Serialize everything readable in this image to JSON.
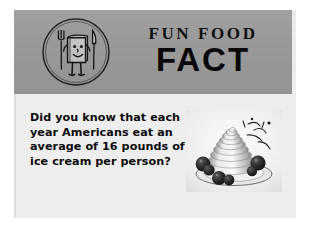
{
  "card": {
    "header": {
      "logo_icon": "fun-food-mascot-medallion-icon",
      "logo_description": "Circle medallion with smiling book mascot flanked by a fork and a knife",
      "title_line1": "FUN FOOD",
      "title_line2": "FACT",
      "background_color": "#9a9a9a"
    },
    "body": {
      "fact_text": "Did you know that each year Americans eat an average of 16 pounds of ice cream per person?",
      "background_color": "#efefef",
      "photo": {
        "icon": "ice-cream-sundae-photo",
        "description": "Black and white photograph of a swirled ice cream sundae with berries on a plate"
      }
    },
    "colors": {
      "page_background": "#ffffff",
      "card_background": "#ededed",
      "text_color": "#0a0a0a"
    }
  }
}
